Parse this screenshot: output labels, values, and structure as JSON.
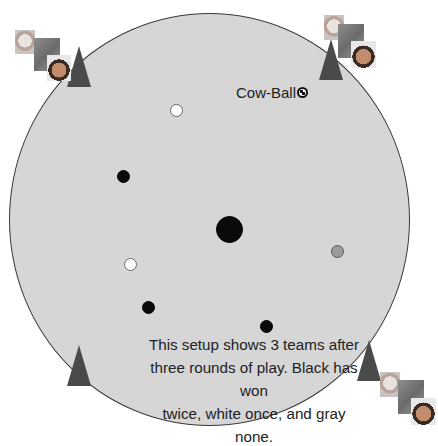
{
  "field": {
    "shape": "circle",
    "color": "#d6d6d6",
    "center": [
      210,
      219
    ],
    "radius": 200
  },
  "cow_ball": {
    "label": "Cow-Ball",
    "icon": "soccer-ball-icon"
  },
  "caption": {
    "line1": "This setup shows 3 teams after",
    "line2": "three rounds of play. Black has won",
    "line3": "twice, white once, and gray none."
  },
  "center_marker": {
    "color": "#000000"
  },
  "team_markers": [
    {
      "team": "black",
      "color": "#0a0a0a"
    },
    {
      "team": "white",
      "color": "#ffffff"
    },
    {
      "team": "black",
      "color": "#0a0a0a"
    },
    {
      "team": "white",
      "color": "#ffffff"
    },
    {
      "team": "black",
      "color": "#0a0a0a"
    },
    {
      "team": "black",
      "color": "#0a0a0a"
    },
    {
      "team": "gray",
      "color": "#9c9c9c"
    }
  ],
  "goals": [
    {
      "position": "top-left",
      "icon": "cone-icon",
      "players": 3
    },
    {
      "position": "top-right",
      "icon": "cone-icon",
      "players": 3
    },
    {
      "position": "bottom-left",
      "icon": "cone-icon",
      "players": 0
    },
    {
      "position": "bottom-right",
      "icon": "cone-icon",
      "players": 3
    }
  ]
}
